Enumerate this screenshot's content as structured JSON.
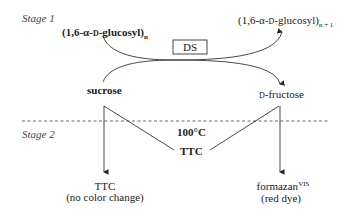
{
  "stages": {
    "stage1": "Stage 1",
    "stage2": "Stage 2"
  },
  "reactants": {
    "glucosyl_n": {
      "prefix": "(1,6-α-",
      "d": "D",
      "suffix": "-glucosyl)",
      "sub": "n"
    },
    "sucrose": "sucrose"
  },
  "products": {
    "glucosyl_n1": {
      "prefix": "(1,6-α-",
      "d": "D",
      "suffix": "-glucosyl)",
      "sub": "n + 1"
    },
    "fructose": {
      "d": "D",
      "suffix": "-fructose"
    }
  },
  "enzyme": "DS",
  "conditions": {
    "temperature": "100°C",
    "reagent": "TTC"
  },
  "outcomes": {
    "left": {
      "line1": "TTC",
      "line2": "(no color change)"
    },
    "right": {
      "line1": "formazan",
      "sup": "VIS",
      "line2": "(red dye)"
    }
  }
}
